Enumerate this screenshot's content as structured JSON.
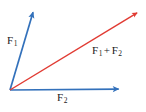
{
  "figure": {
    "kind": "vector-addition-diagram",
    "width": 146,
    "height": 112,
    "background_color": "#ffffff"
  },
  "colors": {
    "vector_blue": "#3371bb",
    "resultant_red": "#e13b33",
    "label_text": "#1a1a1a"
  },
  "labels": {
    "f1": {
      "symbol": "F",
      "subscript": "1"
    },
    "f2": {
      "symbol": "F",
      "subscript": "2"
    },
    "sum": {
      "first_symbol": "F",
      "first_subscript": "1",
      "operator": "+",
      "second_symbol": "F",
      "second_subscript": "2"
    }
  },
  "chart_data": {
    "type": "scatter",
    "title": "",
    "xlabel": "",
    "ylabel": "",
    "grid": false,
    "legend": "none",
    "origin": {
      "x": 10,
      "y": 90
    },
    "vectors": [
      {
        "name": "F1",
        "label": "F₁",
        "color": "#3371bb",
        "start": {
          "x": 10,
          "y": 90
        },
        "end": {
          "x": 34,
          "y": 9
        },
        "components": {
          "dx": 24,
          "dy": -81
        },
        "label_position": {
          "x": 7,
          "y": 35
        }
      },
      {
        "name": "F2",
        "label": "F₂",
        "color": "#3371bb",
        "start": {
          "x": 10,
          "y": 90
        },
        "end": {
          "x": 122,
          "y": 89
        },
        "components": {
          "dx": 112,
          "dy": -1
        },
        "label_position": {
          "x": 57,
          "y": 92
        }
      },
      {
        "name": "F1+F2",
        "label": "F₁ + F₂",
        "color": "#e13b33",
        "start": {
          "x": 10,
          "y": 90
        },
        "end": {
          "x": 140,
          "y": 11
        },
        "components": {
          "dx": 130,
          "dy": -79
        },
        "label_position": {
          "x": 92,
          "y": 45
        }
      }
    ]
  }
}
